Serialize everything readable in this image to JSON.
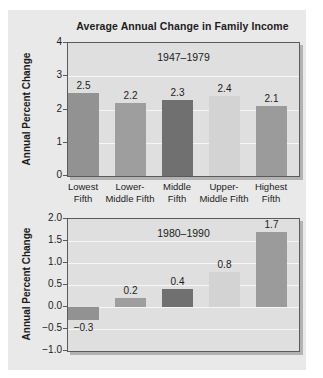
{
  "colors": {
    "page_bg": "#ffffff",
    "panel_bg": "#e9e9e9",
    "plot_bg": "#dfdfdf",
    "plot_border": "#5a5a5a",
    "plot_shadow": "#b2b2b2",
    "gridline": "#f6f6f6",
    "text": "#1c1c1c",
    "bar_colors": [
      "#929292",
      "#9e9e9e",
      "#707070",
      "#d3d3d3",
      "#9b9b9b"
    ]
  },
  "chart_data": [
    {
      "type": "bar",
      "title": "Average Annual Change in Family Income",
      "subtitle": "1947–1979",
      "ylabel": "Annual Percent Change",
      "xlabel": "",
      "categories": [
        [
          "Lowest",
          "Fifth"
        ],
        [
          "Lower-",
          "Middle Fifth"
        ],
        [
          "Middle",
          "Fifth"
        ],
        [
          "Upper-",
          "Middle Fifth"
        ],
        [
          "Highest",
          "Fifth"
        ]
      ],
      "values": [
        2.5,
        2.2,
        2.3,
        2.4,
        2.1
      ],
      "value_labels": [
        "2.5",
        "2.2",
        "2.3",
        "2.4",
        "2.1"
      ],
      "ylim": [
        0,
        4
      ],
      "tick_values": [
        4,
        3,
        2,
        1,
        0
      ],
      "tick_labels": [
        "4",
        "3",
        "2",
        "1",
        "0"
      ],
      "grid": true,
      "legend": false
    },
    {
      "type": "bar",
      "subtitle": "1980–1990",
      "ylabel": "Annual Percent Change",
      "xlabel": "",
      "values": [
        -0.3,
        0.2,
        0.4,
        0.8,
        1.7
      ],
      "value_labels": [
        "−0.3",
        "0.2",
        "0.4",
        "0.8",
        "1.7"
      ],
      "ylim": [
        -1,
        2
      ],
      "tick_values": [
        2.0,
        1.5,
        1.0,
        0.5,
        0.0,
        -0.5,
        -1.0
      ],
      "tick_labels": [
        "2.0",
        "1.5",
        "1.0",
        "0.5",
        "0.0",
        "−0.5",
        "−1.0"
      ],
      "grid": true,
      "legend": false
    }
  ]
}
